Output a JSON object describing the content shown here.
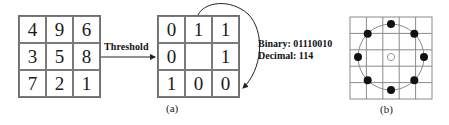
{
  "figure": {
    "input_grid": {
      "label": "3x3 pixel neighborhood",
      "values": [
        [
          "4",
          "9",
          "6"
        ],
        [
          "3",
          "5",
          "8"
        ],
        [
          "7",
          "2",
          "1"
        ]
      ]
    },
    "arrow_label": "Threshold",
    "threshold_grid": {
      "values": [
        [
          "0",
          "1",
          "1"
        ],
        [
          "0",
          "",
          "1"
        ],
        [
          "1",
          "0",
          "0"
        ]
      ]
    },
    "binary_text": "Binary: 01110010",
    "decimal_text": "Decimal: 114",
    "caption_a": "(a)",
    "caption_b": "(b)",
    "circular_neighborhood": {
      "grid_size": 5,
      "sample_points": 8,
      "center": "open-circle",
      "neighbors": "filled-circles"
    },
    "colors": {
      "line": "#6e6e6e",
      "text": "#111111",
      "dot": "#111111"
    }
  }
}
